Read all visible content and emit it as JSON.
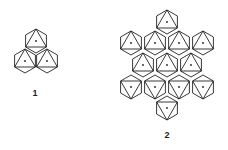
{
  "figures": [
    {
      "label": "1",
      "label_pos": [
        35,
        92
      ],
      "hex_radius": 12,
      "hexes": [
        {
          "cx": 36,
          "cy": 41,
          "tri": "up"
        },
        {
          "cx": 25,
          "cy": 61,
          "tri": "up"
        },
        {
          "cx": 47,
          "cy": 61,
          "tri": "up"
        }
      ]
    },
    {
      "label": "2",
      "label_pos": [
        167,
        133
      ],
      "hex_radius": 12,
      "hexes": [
        {
          "cx": 167,
          "cy": 22,
          "tri": "up"
        },
        {
          "cx": 131,
          "cy": 43,
          "tri": "up"
        },
        {
          "cx": 155,
          "cy": 43,
          "tri": "up"
        },
        {
          "cx": 179,
          "cy": 43,
          "tri": "up"
        },
        {
          "cx": 203,
          "cy": 43,
          "tri": "up"
        },
        {
          "cx": 143,
          "cy": 65,
          "tri": "up"
        },
        {
          "cx": 167,
          "cy": 65,
          "tri": "up"
        },
        {
          "cx": 191,
          "cy": 65,
          "tri": "up"
        },
        {
          "cx": 131,
          "cy": 87,
          "tri": "down"
        },
        {
          "cx": 155,
          "cy": 87,
          "tri": "down"
        },
        {
          "cx": 179,
          "cy": 87,
          "tri": "down"
        },
        {
          "cx": 203,
          "cy": 87,
          "tri": "down"
        },
        {
          "cx": 167,
          "cy": 108,
          "tri": "down"
        }
      ]
    }
  ],
  "colors": {
    "stroke": "#222222",
    "background": "#ffffff"
  }
}
